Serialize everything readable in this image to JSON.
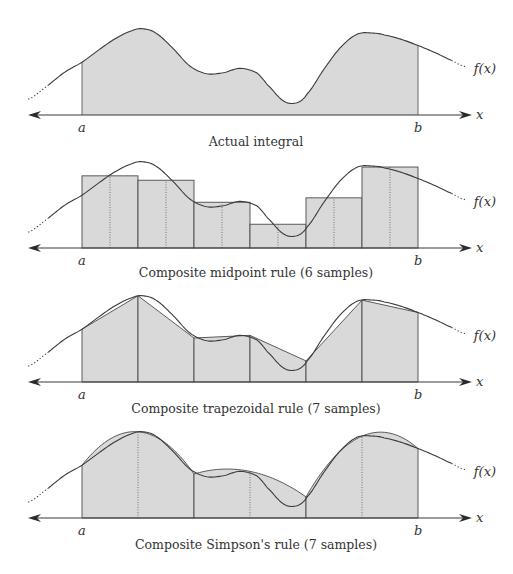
{
  "figure": {
    "function_label": "f(x)",
    "axis_label": "x",
    "lower_bound_label": "a",
    "upper_bound_label": "b",
    "curve_samples": {
      "description": "f(t) at normalized t in [0,1] from a to b; t<0 and t>1 extend beyond bounds; value is relative height (0 = axis, 1 = top of plot)",
      "t": [
        -0.16,
        -0.1,
        -0.05,
        0.0,
        0.05,
        0.1,
        0.15,
        0.18,
        0.22,
        0.27,
        0.32,
        0.37,
        0.42,
        0.47,
        0.52,
        0.55,
        0.6,
        0.64,
        0.67,
        0.72,
        0.77,
        0.82,
        0.87,
        0.9,
        0.95,
        1.0,
        1.05,
        1.1,
        1.14
      ],
      "f": [
        0.18,
        0.34,
        0.49,
        0.6,
        0.74,
        0.87,
        0.96,
        0.98,
        0.93,
        0.76,
        0.56,
        0.47,
        0.48,
        0.53,
        0.48,
        0.35,
        0.16,
        0.14,
        0.24,
        0.52,
        0.77,
        0.92,
        0.93,
        0.91,
        0.86,
        0.79,
        0.71,
        0.62,
        0.55
      ]
    },
    "panels": [
      {
        "id": "actual",
        "caption": "Actual integral",
        "method": "exact",
        "samples": null
      },
      {
        "id": "midpoint",
        "caption": "Composite midpoint rule (6 samples)",
        "method": "midpoint",
        "samples": 6,
        "bar_heights": [
          0.82,
          0.77,
          0.52,
          0.27,
          0.57,
          0.92
        ]
      },
      {
        "id": "trapezoidal",
        "caption": "Composite trapezoidal rule (7 samples)",
        "method": "trapezoidal",
        "samples": 7,
        "node_values": [
          0.6,
          0.98,
          0.5,
          0.53,
          0.24,
          0.93,
          0.79
        ]
      },
      {
        "id": "simpson",
        "caption": "Composite Simpson's rule (7 samples)",
        "method": "simpson",
        "samples": 7,
        "node_values": [
          0.6,
          0.98,
          0.5,
          0.53,
          0.24,
          0.93,
          0.79
        ]
      }
    ]
  }
}
